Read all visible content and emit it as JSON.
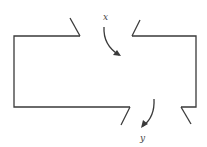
{
  "diagram": {
    "type": "flow-box",
    "labels": {
      "inlet": "x",
      "outlet": "y"
    },
    "colors": {
      "line": "#3a3a3a",
      "background": "#ffffff"
    }
  }
}
